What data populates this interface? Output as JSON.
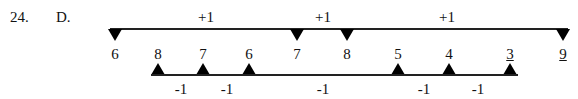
{
  "question": {
    "number": "24.",
    "answer": "D."
  },
  "top_line": {
    "x_start": 110,
    "x_end": 568,
    "y": 29,
    "markers": [
      {
        "label": "6",
        "x": 115
      },
      {
        "label": "7",
        "x": 297
      },
      {
        "label": "8",
        "x": 347
      },
      {
        "label": "9",
        "x": 563
      }
    ],
    "steps": [
      {
        "label": "+1",
        "x": 206
      },
      {
        "label": "+1",
        "x": 323
      },
      {
        "label": "+1",
        "x": 447
      }
    ]
  },
  "bottom_line": {
    "x_start": 151,
    "x_end": 518,
    "y": 74,
    "markers": [
      {
        "label": "8",
        "x": 158
      },
      {
        "label": "7",
        "x": 203
      },
      {
        "label": "6",
        "x": 249
      },
      {
        "label": "5",
        "x": 398
      },
      {
        "label": "4",
        "x": 449
      },
      {
        "label": "3",
        "x": 510
      }
    ],
    "steps": [
      {
        "label": "-1",
        "x": 181
      },
      {
        "label": "-1",
        "x": 227
      },
      {
        "label": "-1",
        "x": 323
      },
      {
        "label": "-1",
        "x": 424
      },
      {
        "label": "-1",
        "x": 478
      }
    ]
  }
}
